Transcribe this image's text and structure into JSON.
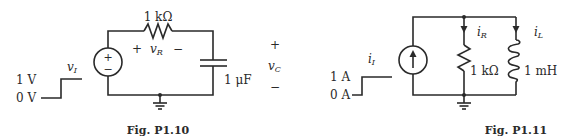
{
  "figures": [
    {
      "id": "P1.10",
      "caption": "Fig. P1.10",
      "input": {
        "symbol": "v",
        "subscript": "I",
        "high_label": "1 V",
        "low_label": "0 V",
        "waveform": "step"
      },
      "source": {
        "type": "voltage-source",
        "plus": "+",
        "minus": "−"
      },
      "components": [
        {
          "type": "resistor",
          "value": "1 kΩ",
          "voltage_symbol": "v",
          "voltage_subscript": "R",
          "plus": "+",
          "minus": "−"
        },
        {
          "type": "capacitor",
          "value": "1 μF",
          "voltage_symbol": "v",
          "voltage_subscript": "C",
          "plus": "+",
          "minus": "−"
        }
      ],
      "ground": true
    },
    {
      "id": "P1.11",
      "caption": "Fig. P1.11",
      "input": {
        "symbol": "i",
        "subscript": "I",
        "high_label": "1 A",
        "low_label": "0 A",
        "waveform": "step"
      },
      "source": {
        "type": "current-source",
        "direction": "up"
      },
      "components": [
        {
          "type": "resistor",
          "value": "1 kΩ",
          "current_symbol": "i",
          "current_subscript": "R"
        },
        {
          "type": "inductor",
          "value": "1 mH",
          "current_symbol": "i",
          "current_subscript": "L"
        }
      ],
      "ground": true
    }
  ]
}
